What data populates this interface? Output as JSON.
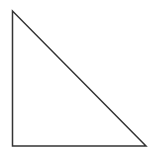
{
  "diagram": {
    "type": "right-triangle",
    "canvas": {
      "width": 158,
      "height": 161,
      "background": "#ffffff"
    },
    "vertices": [
      {
        "name": "top",
        "x": 12.5,
        "y": 11
      },
      {
        "name": "bottom-left",
        "x": 12.5,
        "y": 146
      },
      {
        "name": "bottom-right",
        "x": 146,
        "y": 146
      }
    ],
    "stroke_color": "#333333",
    "stroke_width": 1.5,
    "fill": "none"
  }
}
